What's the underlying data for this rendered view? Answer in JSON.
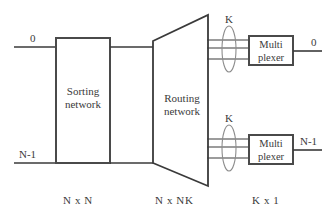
{
  "figure": {
    "title": "",
    "inputs": [
      {
        "name": "input-top",
        "label": "0"
      },
      {
        "name": "input-bottom",
        "label": "N-1"
      }
    ],
    "outputs": [
      {
        "name": "output-top",
        "label": "0"
      },
      {
        "name": "output-bottom",
        "label": "N-1"
      }
    ],
    "blocks": [
      {
        "name": "sorting-network",
        "label_line1": "Sorting",
        "label_line2": "network",
        "spec": "N x N",
        "shape": "rectangle"
      },
      {
        "name": "routing-network",
        "label_line1": "Routing",
        "label_line2": "network",
        "spec": "N x NK",
        "shape": "trapezoid"
      },
      {
        "name": "multiplexer-top",
        "label_line1": "Multi",
        "label_line2": "plexer",
        "spec": "K x 1",
        "shape": "rectangle"
      },
      {
        "name": "multiplexer-bottom",
        "label_line1": "Multi",
        "label_line2": "plexer",
        "spec": "K x 1",
        "shape": "rectangle"
      }
    ],
    "bundles": [
      {
        "name": "bundle-top",
        "label": "K",
        "line_count": 3
      },
      {
        "name": "bundle-bottom",
        "label": "K",
        "line_count": 3
      }
    ],
    "specs": [
      {
        "name": "spec-sorting",
        "label": "N x N"
      },
      {
        "name": "spec-routing",
        "label": "N x NK"
      },
      {
        "name": "spec-multiplexer",
        "label": "K x 1"
      }
    ],
    "colors": {
      "line": "#3a3a3a",
      "box_border": "#4a4a4a",
      "background": "#ffffff",
      "text": "#3a3a3a"
    }
  }
}
